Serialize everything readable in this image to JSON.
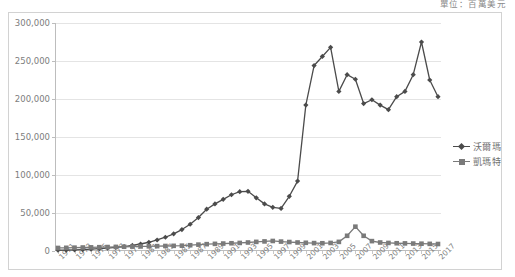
{
  "caption": {
    "unit_note": "單位：百萬美元"
  },
  "legend": {
    "position": "right",
    "entries": [
      {
        "name": "walmart",
        "label": "沃爾瑪",
        "color": "#4b4b4b",
        "marker": "diamond"
      },
      {
        "name": "kmart",
        "label": "凱瑪特",
        "color": "#7a7a7a",
        "marker": "square"
      }
    ]
  },
  "chart_data": {
    "type": "line",
    "title": "",
    "subtitle": "",
    "xlabel": "",
    "ylabel": "",
    "unit": "單位：百萬美元",
    "grid": true,
    "legend_position": "right",
    "ylim": [
      0,
      300000
    ],
    "yticks": [
      0,
      50000,
      100000,
      150000,
      200000,
      250000,
      300000
    ],
    "ytick_labels": [
      "0",
      "50,000",
      "100,000",
      "150,000",
      "200,000",
      "250,000",
      "300,000"
    ],
    "xlim": [
      1971,
      2017
    ],
    "x": [
      1971,
      1972,
      1973,
      1974,
      1975,
      1976,
      1977,
      1978,
      1979,
      1980,
      1981,
      1982,
      1983,
      1984,
      1985,
      1986,
      1987,
      1988,
      1989,
      1990,
      1991,
      1992,
      1993,
      1994,
      1995,
      1996,
      1997,
      1998,
      1999,
      2000,
      2001,
      2002,
      2003,
      2004,
      2005,
      2006,
      2007,
      2008,
      2009,
      2010,
      2011,
      2012,
      2013,
      2014,
      2015,
      2016,
      2017
    ],
    "xtick_labels": [
      "1971",
      "1973",
      "1975",
      "1977",
      "1979",
      "1981",
      "1983",
      "1985",
      "1987",
      "1989",
      "1991",
      "1993",
      "1995",
      "1997",
      "1999",
      "2001",
      "2003",
      "2005",
      "2007",
      "2009",
      "2011",
      "2013",
      "2015",
      "2017"
    ],
    "xtick_step": 2,
    "series": [
      {
        "name": "沃爾瑪",
        "key": "walmart",
        "color": "#4b4b4b",
        "marker": "diamond",
        "values": [
          1000,
          1200,
          1500,
          1900,
          2400,
          3000,
          3800,
          4700,
          5900,
          7400,
          9200,
          11500,
          14500,
          18100,
          22600,
          28200,
          35200,
          44000,
          55000,
          62000,
          68000,
          74000,
          78000,
          78500,
          70000,
          62000,
          57500,
          56000,
          72000,
          92000,
          192000,
          244000,
          256000,
          268000,
          210000,
          232000,
          226000,
          194000,
          199000,
          192000,
          186000,
          203000,
          210000,
          232000,
          275000,
          225000,
          203000
        ]
      },
      {
        "name": "凱瑪特",
        "key": "kmart",
        "color": "#7a7a7a",
        "marker": "square",
        "values": [
          4000,
          4200,
          4400,
          4600,
          4800,
          5000,
          5200,
          5400,
          5600,
          5800,
          6000,
          6200,
          6400,
          6600,
          6800,
          7000,
          7600,
          8400,
          9000,
          9400,
          9800,
          10200,
          10600,
          11200,
          12000,
          12600,
          13200,
          12400,
          11800,
          11200,
          10800,
          10400,
          10200,
          10600,
          12000,
          20000,
          32000,
          20000,
          13000,
          11200,
          10600,
          10200,
          10000,
          9800,
          9600,
          9400,
          9200
        ]
      }
    ],
    "notes": {
      "walmart_peak_year": 2015,
      "walmart_peak_value": 275000,
      "kmart_peak_year": 2007,
      "kmart_peak_value": 32000,
      "walmart_1994_local_peak": 78500,
      "walmart_2004_local_peak": 268000
    }
  }
}
